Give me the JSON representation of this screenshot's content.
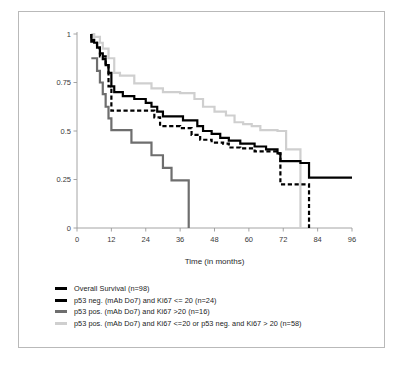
{
  "figure": {
    "border_color": "#b9b9b9",
    "background": "#ffffff"
  },
  "chart_data": {
    "type": "line",
    "subtype": "kaplan-meier-step",
    "title": "",
    "xlabel": "Time (in months)",
    "ylabel": "",
    "xlim": [
      0,
      96
    ],
    "ylim": [
      0,
      1
    ],
    "xticks": [
      0,
      12,
      24,
      36,
      48,
      60,
      72,
      84,
      96
    ],
    "xtick_labels": [
      "0",
      "12",
      "24",
      "36",
      "48",
      "60",
      "72",
      "84",
      "96"
    ],
    "yticks": [
      0,
      0.25,
      0.5,
      0.75,
      1
    ],
    "ytick_labels": [
      "0",
      "0.25",
      "0.5",
      "0.75",
      "1"
    ],
    "grid": false,
    "legend_position": "below",
    "series": [
      {
        "name": "Overall Survival (n=98)",
        "color": "#000000",
        "style": "solid",
        "width": 2.2,
        "points": [
          [
            5,
            1.0
          ],
          [
            5,
            0.97
          ],
          [
            6,
            0.97
          ],
          [
            6,
            0.955
          ],
          [
            7,
            0.955
          ],
          [
            7,
            0.93
          ],
          [
            8,
            0.93
          ],
          [
            8,
            0.9
          ],
          [
            9,
            0.9
          ],
          [
            9,
            0.87
          ],
          [
            10,
            0.87
          ],
          [
            10,
            0.84
          ],
          [
            11,
            0.84
          ],
          [
            11,
            0.8
          ],
          [
            12,
            0.8
          ],
          [
            12,
            0.73
          ],
          [
            13,
            0.73
          ],
          [
            13,
            0.7
          ],
          [
            16,
            0.7
          ],
          [
            16,
            0.68
          ],
          [
            20,
            0.68
          ],
          [
            20,
            0.665
          ],
          [
            24,
            0.665
          ],
          [
            24,
            0.645
          ],
          [
            26,
            0.645
          ],
          [
            26,
            0.625
          ],
          [
            28,
            0.625
          ],
          [
            28,
            0.6
          ],
          [
            30,
            0.6
          ],
          [
            30,
            0.575
          ],
          [
            37,
            0.575
          ],
          [
            37,
            0.555
          ],
          [
            42,
            0.555
          ],
          [
            42,
            0.525
          ],
          [
            44,
            0.525
          ],
          [
            44,
            0.5
          ],
          [
            47,
            0.5
          ],
          [
            47,
            0.485
          ],
          [
            50,
            0.485
          ],
          [
            50,
            0.465
          ],
          [
            53,
            0.465
          ],
          [
            53,
            0.45
          ],
          [
            57,
            0.45
          ],
          [
            57,
            0.435
          ],
          [
            62,
            0.435
          ],
          [
            62,
            0.42
          ],
          [
            66,
            0.42
          ],
          [
            66,
            0.405
          ],
          [
            70,
            0.405
          ],
          [
            70,
            0.385
          ],
          [
            71,
            0.385
          ],
          [
            71,
            0.345
          ],
          [
            78,
            0.345
          ],
          [
            78,
            0.335
          ],
          [
            81,
            0.335
          ],
          [
            81,
            0.26
          ],
          [
            96,
            0.26
          ]
        ]
      },
      {
        "name": "p53 neg. (mAb Do7) and Ki67 <= 20 (n=24)",
        "color": "#000000",
        "style": "dashed",
        "width": 2.2,
        "points": [
          [
            5,
            1.0
          ],
          [
            5,
            0.96
          ],
          [
            7,
            0.96
          ],
          [
            7,
            0.93
          ],
          [
            8,
            0.93
          ],
          [
            8,
            0.885
          ],
          [
            10,
            0.885
          ],
          [
            10,
            0.84
          ],
          [
            11,
            0.84
          ],
          [
            11,
            0.73
          ],
          [
            12,
            0.73
          ],
          [
            12,
            0.605
          ],
          [
            27,
            0.605
          ],
          [
            27,
            0.57
          ],
          [
            29,
            0.57
          ],
          [
            29,
            0.525
          ],
          [
            36,
            0.525
          ],
          [
            36,
            0.515
          ],
          [
            40,
            0.515
          ],
          [
            40,
            0.48
          ],
          [
            43,
            0.48
          ],
          [
            43,
            0.455
          ],
          [
            47,
            0.455
          ],
          [
            47,
            0.44
          ],
          [
            51,
            0.44
          ],
          [
            51,
            0.435
          ],
          [
            53,
            0.435
          ],
          [
            53,
            0.415
          ],
          [
            57,
            0.415
          ],
          [
            57,
            0.41
          ],
          [
            62,
            0.41
          ],
          [
            62,
            0.395
          ],
          [
            70,
            0.395
          ],
          [
            70,
            0.385
          ],
          [
            71,
            0.385
          ],
          [
            71,
            0.225
          ],
          [
            81,
            0.225
          ],
          [
            81,
            0.0
          ]
        ]
      },
      {
        "name": "p53 pos. (mAb Do7) and Ki67 >20 (n=16)",
        "color": "#6e6e6e",
        "style": "solid",
        "width": 2.2,
        "points": [
          [
            5,
            0.875
          ],
          [
            7,
            0.875
          ],
          [
            7,
            0.81
          ],
          [
            8,
            0.81
          ],
          [
            8,
            0.75
          ],
          [
            9,
            0.75
          ],
          [
            9,
            0.69
          ],
          [
            10,
            0.69
          ],
          [
            10,
            0.625
          ],
          [
            11,
            0.625
          ],
          [
            11,
            0.565
          ],
          [
            12,
            0.565
          ],
          [
            12,
            0.505
          ],
          [
            19,
            0.505
          ],
          [
            19,
            0.44
          ],
          [
            26,
            0.44
          ],
          [
            26,
            0.375
          ],
          [
            30,
            0.375
          ],
          [
            30,
            0.31
          ],
          [
            33,
            0.31
          ],
          [
            33,
            0.245
          ],
          [
            39,
            0.245
          ],
          [
            39,
            0.0
          ]
        ]
      },
      {
        "name": "p53 pos. (mAb Do7) and Ki67 <=20 or p53 neg. and Ki67 > 20 (n=58)",
        "color": "#cfcfcf",
        "style": "solid",
        "width": 2.2,
        "points": [
          [
            5,
            1.0
          ],
          [
            6,
            1.0
          ],
          [
            6,
            0.985
          ],
          [
            8,
            0.985
          ],
          [
            8,
            0.955
          ],
          [
            9,
            0.955
          ],
          [
            9,
            0.925
          ],
          [
            11,
            0.925
          ],
          [
            11,
            0.875
          ],
          [
            13,
            0.875
          ],
          [
            13,
            0.8
          ],
          [
            15,
            0.8
          ],
          [
            15,
            0.785
          ],
          [
            20,
            0.785
          ],
          [
            20,
            0.745
          ],
          [
            26,
            0.745
          ],
          [
            26,
            0.72
          ],
          [
            30,
            0.72
          ],
          [
            30,
            0.7
          ],
          [
            36,
            0.7
          ],
          [
            36,
            0.695
          ],
          [
            41,
            0.695
          ],
          [
            41,
            0.665
          ],
          [
            44,
            0.665
          ],
          [
            44,
            0.625
          ],
          [
            48,
            0.625
          ],
          [
            48,
            0.6
          ],
          [
            52,
            0.6
          ],
          [
            52,
            0.58
          ],
          [
            55,
            0.58
          ],
          [
            55,
            0.545
          ],
          [
            58,
            0.545
          ],
          [
            58,
            0.535
          ],
          [
            61,
            0.535
          ],
          [
            61,
            0.525
          ],
          [
            64,
            0.525
          ],
          [
            64,
            0.505
          ],
          [
            70,
            0.505
          ],
          [
            70,
            0.5
          ],
          [
            73,
            0.5
          ],
          [
            73,
            0.405
          ],
          [
            78,
            0.405
          ],
          [
            78,
            0.0
          ]
        ]
      }
    ]
  },
  "legend": {
    "items": [
      {
        "label": "Overall Survival (n=98)",
        "color": "#000000",
        "style": "solid"
      },
      {
        "label": "p53 neg. (mAb Do7) and Ki67 <= 20 (n=24)",
        "color": "#000000",
        "style": "dashed"
      },
      {
        "label": "p53 pos. (mAb Do7) and Ki67 >20 (n=16)",
        "color": "#6e6e6e",
        "style": "solid"
      },
      {
        "label": "p53 pos. (mAb Do7) and Ki67 <=20 or p53 neg. and Ki67 > 20 (n=58)",
        "color": "#cfcfcf",
        "style": "solid"
      }
    ]
  }
}
